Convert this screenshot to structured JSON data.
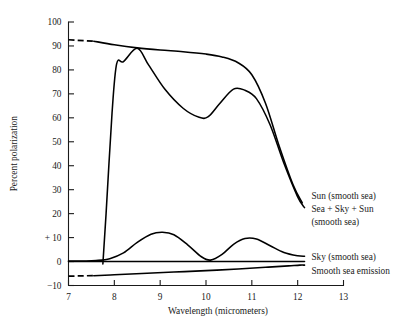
{
  "chart_data": {
    "type": "line",
    "title": "",
    "xlabel": "Wavelength (micrometers)",
    "ylabel": "Percent polarization",
    "xlim": [
      7,
      13
    ],
    "ylim": [
      -10,
      100
    ],
    "grid": false,
    "legend_position": "right-inline-annotations",
    "xticks": [
      7,
      8,
      9,
      10,
      11,
      12,
      13
    ],
    "xtick_labels": [
      "7",
      "8",
      "9",
      "10",
      "11",
      "12",
      "13"
    ],
    "yticks": [
      -10,
      0,
      10,
      20,
      30,
      40,
      50,
      60,
      70,
      80,
      90,
      100
    ],
    "ytick_labels": [
      "−10",
      "0",
      "+ 10",
      "20",
      "30",
      "40",
      "50",
      "60",
      "70",
      "80",
      "90",
      "100"
    ],
    "series": [
      {
        "name": "Sun (smooth sea)",
        "style": "solid",
        "x": [
          7.55,
          8.0,
          8.5,
          9.0,
          9.5,
          10.0,
          10.35,
          10.7,
          11.0,
          11.3,
          11.6,
          11.9,
          12.1
        ],
        "values": [
          92.0,
          90.5,
          89.2,
          88.3,
          87.6,
          86.6,
          85.4,
          83.0,
          78.0,
          66.0,
          48.0,
          32.0,
          24.5
        ]
      },
      {
        "name": "Sun (smooth sea) leader",
        "style": "dashed",
        "x": [
          7.0,
          7.6
        ],
        "values": [
          92.6,
          91.9
        ]
      },
      {
        "name": "Sea + Sky + Sun (smooth sea)",
        "style": "solid",
        "x": [
          7.75,
          7.82,
          7.95,
          8.05,
          8.2,
          8.5,
          8.75,
          9.1,
          9.5,
          9.85,
          10.05,
          10.3,
          10.6,
          10.85,
          11.1,
          11.4,
          11.7,
          12.0,
          12.15
        ],
        "values": [
          -1.0,
          20.0,
          62.0,
          82.5,
          83.5,
          89.0,
          82.0,
          72.0,
          64.0,
          60.2,
          60.5,
          66.0,
          72.0,
          71.5,
          68.0,
          57.0,
          41.0,
          27.0,
          22.5
        ]
      },
      {
        "name": "Sky (smooth sea)",
        "style": "solid",
        "x": [
          7.0,
          7.35,
          7.6,
          7.9,
          8.2,
          8.5,
          8.8,
          9.05,
          9.3,
          9.6,
          9.9,
          10.1,
          10.35,
          10.6,
          10.85,
          11.1,
          11.4,
          11.7,
          12.0,
          12.15
        ],
        "values": [
          0.2,
          0.2,
          0.4,
          1.2,
          3.6,
          8.0,
          11.4,
          12.2,
          11.2,
          7.0,
          2.0,
          0.6,
          3.0,
          7.2,
          9.6,
          9.4,
          6.6,
          3.8,
          2.4,
          2.2
        ]
      },
      {
        "name": "Zero reference line",
        "style": "solid",
        "x": [
          7.0,
          12.15
        ],
        "values": [
          0.0,
          0.0
        ]
      },
      {
        "name": "Smooth sea emission",
        "style": "solid",
        "x": [
          7.55,
          8.0,
          8.6,
          9.3,
          10.0,
          10.7,
          11.3,
          11.8,
          12.05,
          12.15
        ],
        "values": [
          -5.9,
          -5.5,
          -5.0,
          -4.4,
          -3.8,
          -3.1,
          -2.4,
          -1.8,
          -1.5,
          -1.5
        ]
      },
      {
        "name": "Smooth sea emission leader",
        "style": "dashed",
        "x": [
          7.0,
          7.6
        ],
        "values": [
          -6.1,
          -5.85
        ]
      }
    ],
    "annotations": [
      {
        "text": "Sun (smooth sea)",
        "x": 12.3,
        "y": 27.5
      },
      {
        "text": "Sea + Sky + Sun",
        "x": 12.3,
        "y": 22.0
      },
      {
        "text": "(smooth sea)",
        "x": 12.3,
        "y": 16.5
      },
      {
        "text": "Sky (smooth sea)",
        "x": 12.3,
        "y": 2.0
      },
      {
        "text": "Smooth sea emission",
        "x": 12.3,
        "y": -4.0
      }
    ]
  }
}
